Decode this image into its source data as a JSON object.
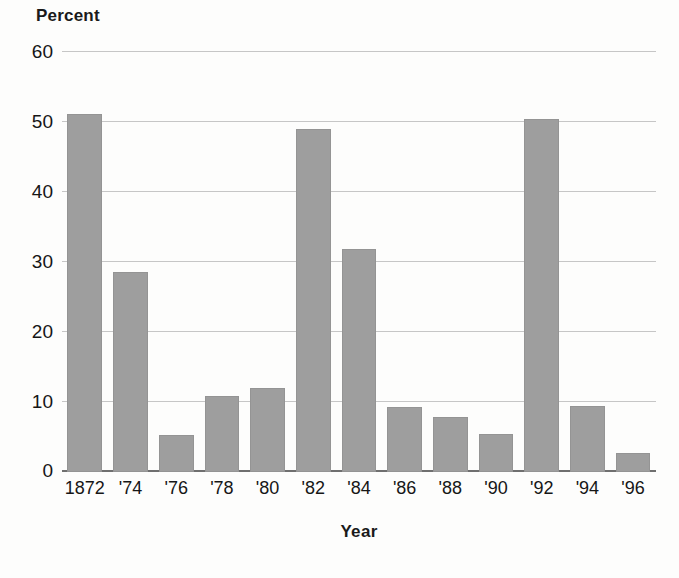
{
  "chart_data": {
    "type": "bar",
    "title": "",
    "subtitle": "",
    "xlabel": "Year",
    "ylabel": "Percent",
    "categories": [
      "1872",
      "'74",
      "'76",
      "'78",
      "'80",
      "'82",
      "'84",
      "'86",
      "'88",
      "'90",
      "'92",
      "'94",
      "'96"
    ],
    "values": [
      51.2,
      28.6,
      5.3,
      10.8,
      12.0,
      49.0,
      31.8,
      9.3,
      7.8,
      5.4,
      50.4,
      9.4,
      2.7
    ],
    "ylim": [
      0,
      60
    ],
    "yticks": [
      0,
      10,
      20,
      30,
      40,
      50,
      60
    ],
    "ytick_labels": [
      "0",
      "10",
      "20",
      "30",
      "40",
      "50",
      "60"
    ],
    "grid": true,
    "legend": false,
    "legend_position": "none",
    "bar_color": "#9e9e9e",
    "gridline_color": "#c6c6c6",
    "axis_color": "#6f6f6f",
    "background_color": "#fdfdfc"
  },
  "axis": {
    "unit_label": "Percent",
    "x_title": "Year"
  }
}
